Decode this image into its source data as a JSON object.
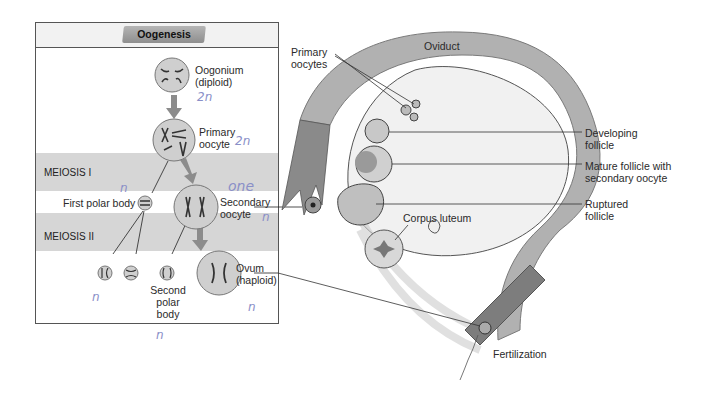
{
  "oogenesis_panel": {
    "title": "Oogenesis",
    "phases": [
      {
        "label": "MEIOSIS I"
      },
      {
        "label": "MEIOSIS II"
      }
    ],
    "cells": {
      "oogonium": {
        "line1": "Oogonium",
        "line2": "(diploid)"
      },
      "primary_oocyte": {
        "line1": "Primary",
        "line2": "oocyte"
      },
      "first_polar_body": {
        "label": "First polar body"
      },
      "secondary_oocyte": {
        "line1": "Secondary",
        "line2": "oocyte"
      },
      "second_polar_body": {
        "line1": "Second",
        "line2": "polar",
        "line3": "body"
      },
      "ovum": {
        "line1": "Ovum",
        "line2": "(haploid)"
      }
    },
    "handwritten_notes": {
      "oogonium": "2n",
      "primary_oocyte": "2n",
      "first_polar_body": "n",
      "secondary_oocyte_top": "one",
      "secondary_oocyte": "n",
      "polar_bodies_from_first": "n",
      "second_polar_body": "n",
      "ovum": "n"
    }
  },
  "ovary_diagram": {
    "labels": {
      "oviduct": "Oviduct",
      "primary_oocytes": {
        "line1": "Primary",
        "line2": "oocytes"
      },
      "developing_follicle": {
        "line1": "Developing",
        "line2": "follicle"
      },
      "mature_follicle": {
        "line1": "Mature follicle with",
        "line2": "secondary oocyte"
      },
      "ruptured_follicle": {
        "line1": "Ruptured",
        "line2": "follicle"
      },
      "corpus_luteum": "Corpus luteum",
      "fertilization": "Fertilization"
    }
  },
  "colors": {
    "band": "#d6d6d6",
    "cell_fill": "#cfcfcf",
    "arrow_gray": "#8c8c8c",
    "handwriting": "#8a8fc8",
    "oviduct_gray": "#a9a9a9"
  }
}
